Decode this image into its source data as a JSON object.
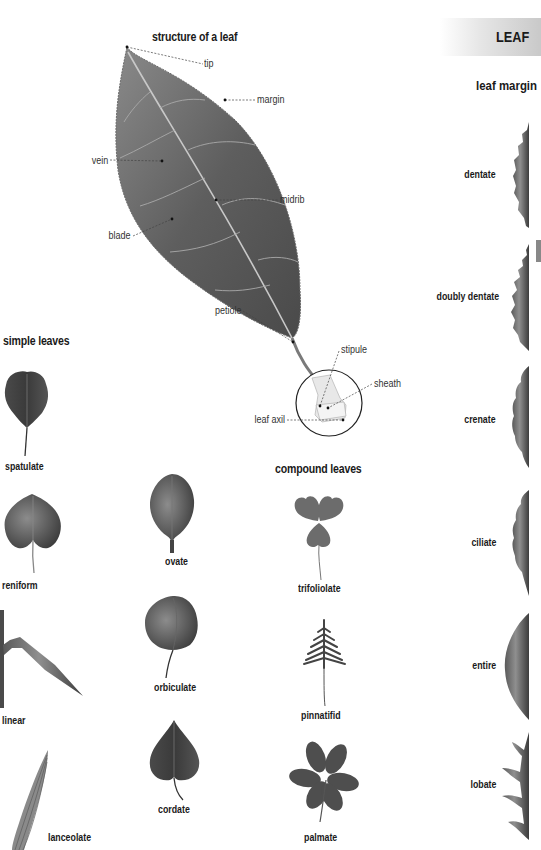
{
  "section": {
    "title": "LEAF",
    "accent_color": "#c9c9c9"
  },
  "structure": {
    "heading": "structure of a leaf",
    "annotations": {
      "tip": "tip",
      "margin": "margin",
      "vein": "vein",
      "midrib": "midrib",
      "blade": "blade",
      "petiole": "petiole",
      "stipule": "stipule",
      "sheath": "sheath",
      "leaf_axil": "leaf axil"
    }
  },
  "simple_leaves": {
    "heading": "simple leaves",
    "items": [
      {
        "label": "spatulate"
      },
      {
        "label": "reniform"
      },
      {
        "label": "ovate"
      },
      {
        "label": "linear"
      },
      {
        "label": "orbiculate"
      },
      {
        "label": "lanceolate"
      },
      {
        "label": "cordate"
      }
    ]
  },
  "compound_leaves": {
    "heading": "compound leaves",
    "items": [
      {
        "label": "trifoliolate"
      },
      {
        "label": "pinnatifid"
      },
      {
        "label": "palmate"
      }
    ]
  },
  "leaf_margin": {
    "heading": "leaf margin",
    "items": [
      {
        "label": "dentate"
      },
      {
        "label": "doubly dentate"
      },
      {
        "label": "crenate"
      },
      {
        "label": "ciliate"
      },
      {
        "label": "entire"
      },
      {
        "label": "lobate"
      }
    ]
  }
}
